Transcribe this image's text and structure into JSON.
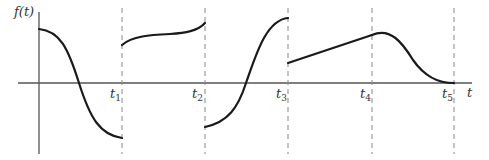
{
  "diagram": {
    "y_axis_label": "f(t)",
    "x_axis_label": "t",
    "time_marks": [
      {
        "base": "t",
        "sub": "1"
      },
      {
        "base": "t",
        "sub": "2"
      },
      {
        "base": "t",
        "sub": "3"
      },
      {
        "base": "t",
        "sub": "4"
      },
      {
        "base": "t",
        "sub": "5"
      }
    ],
    "colors": {
      "curve": "#1a1a1a",
      "axis": "#555555",
      "dashed": "#888888",
      "background": "#ffffff"
    },
    "segments": [
      {
        "interval": "0 to t1",
        "shape": "decreasing S-curve from high positive to negative"
      },
      {
        "interval": "t1 to t2",
        "shape": "positive jump, gently rising curve"
      },
      {
        "interval": "t2 to t3",
        "shape": "negative jump, increasing S-curve to high positive"
      },
      {
        "interval": "t3 to t4",
        "shape": "positive jump, linear rise"
      },
      {
        "interval": "t4 to t5",
        "shape": "bell peak decaying to zero at t5"
      }
    ]
  }
}
